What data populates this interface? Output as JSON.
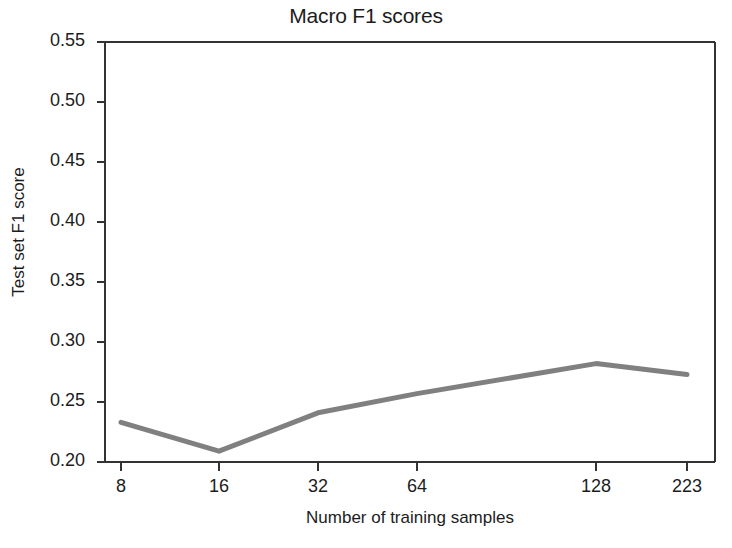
{
  "chart_data": {
    "type": "line",
    "title": "Macro F1 scores",
    "xlabel": "Number of training samples",
    "ylabel": "Test set F1 score",
    "categories": [
      "8",
      "16",
      "32",
      "64",
      "128",
      "223"
    ],
    "values": [
      0.233,
      0.209,
      0.241,
      0.257,
      0.282,
      0.273
    ],
    "series": [
      {
        "name": "Macro F1",
        "values": [
          0.233,
          0.209,
          0.241,
          0.257,
          0.282,
          0.273
        ],
        "color": "#808080"
      }
    ],
    "ylim": [
      0.2,
      0.55
    ],
    "ytick_labels": [
      "0.20",
      "0.25",
      "0.30",
      "0.35",
      "0.40",
      "0.45",
      "0.50",
      "0.55"
    ],
    "ytick_values": [
      0.2,
      0.25,
      0.3,
      0.35,
      0.4,
      0.45,
      0.5,
      0.55
    ],
    "xtick_labels": [
      "8",
      "16",
      "32",
      "64",
      "128",
      "223"
    ],
    "grid": false,
    "legend": false,
    "line_color": "#808080",
    "axis_color": "#333333",
    "background_color": "#ffffff"
  }
}
